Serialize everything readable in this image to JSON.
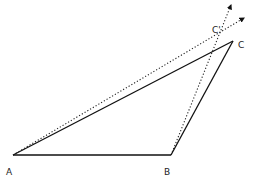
{
  "diagram": {
    "type": "geometry-triangle",
    "colors": {
      "line": "#111111",
      "dotted": "#222222",
      "label": "#222222",
      "background": "#ffffff"
    },
    "points": {
      "A": {
        "label": "A",
        "x": 13,
        "y": 155
      },
      "B": {
        "label": "B",
        "x": 171,
        "y": 155
      },
      "C": {
        "label": "C",
        "x": 233,
        "y": 41
      },
      "C_prime": {
        "label": "C'"
      }
    },
    "labels": {
      "A": {
        "text": "A",
        "x": 6,
        "y": 175
      },
      "B": {
        "text": "B",
        "x": 164,
        "y": 175
      },
      "C": {
        "text": "C",
        "x": 238,
        "y": 48
      },
      "C_prime": {
        "text": "C'",
        "x": 212,
        "y": 33
      }
    },
    "solid_edges": [
      {
        "from": "A",
        "to": "B"
      },
      {
        "from": "B",
        "to": "C"
      },
      {
        "from": "A",
        "to": "C"
      }
    ],
    "dotted_rays": [
      {
        "from": "A",
        "end": {
          "x": 244,
          "y": 18
        }
      },
      {
        "from": "B",
        "end": {
          "x": 231,
          "y": 5
        }
      }
    ]
  }
}
